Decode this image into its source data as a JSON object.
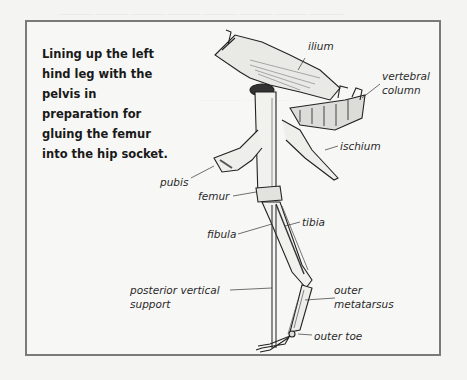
{
  "caption": "Lining up the left hind leg with the pelvis in preparation for gluing the femur into the hip socket.",
  "labels": {
    "ilium": "ilium",
    "vertebral_column_line1": "vertebral",
    "vertebral_column_line2": "column",
    "ischium": "ischium",
    "pubis": "pubis",
    "femur": "femur",
    "tibia": "tibia",
    "fibula": "fibula",
    "posterior_support_line1": "posterior vertical",
    "posterior_support_line2": "support",
    "outer_metatarsus_line1": "outer",
    "outer_metatarsus_line2": "metatarsus",
    "outer_toe": "outer toe"
  },
  "colors": {
    "frame_border": "#7a7a78",
    "ink": "#1a1a1a",
    "page": "#f4f4f2"
  }
}
